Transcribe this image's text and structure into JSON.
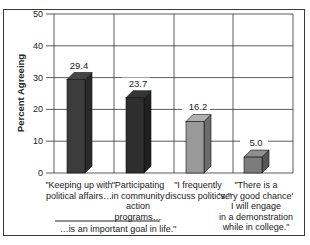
{
  "chart_data": {
    "type": "bar",
    "style": "3d",
    "title": "",
    "xlabel": "",
    "ylabel": "Percent Agreeing",
    "ylim": [
      0,
      50
    ],
    "yticks": [
      0,
      10,
      20,
      30,
      40,
      50
    ],
    "grid": true,
    "legend": null,
    "categories": [
      "\"Keeping up with political affairs…",
      "\"Participating in community action programs…",
      "\"I frequently discuss politics.\"",
      "\"There is a 'very good chance' I will engage in a demonstration while in college.\""
    ],
    "category_lines": [
      [
        "\"Keeping up with",
        "political affairs…"
      ],
      [
        "\"Participating",
        "in community",
        "action",
        "programs…"
      ],
      [
        "\"I frequently",
        "discuss politics.\""
      ],
      [
        "\"There is a",
        "'very good chance'",
        "I will engage",
        "in a demonstration",
        "while in college.\""
      ]
    ],
    "values": [
      29.4,
      23.7,
      16.2,
      5.0
    ],
    "value_labels": [
      "29.4",
      "23.7",
      "16.2",
      "5.0"
    ],
    "bar_colors": [
      "#3c3c3c",
      "#2e2e2e",
      "#9a9a9a",
      "#7c7c7c"
    ],
    "annotation": "…is an important goal in life.\""
  }
}
